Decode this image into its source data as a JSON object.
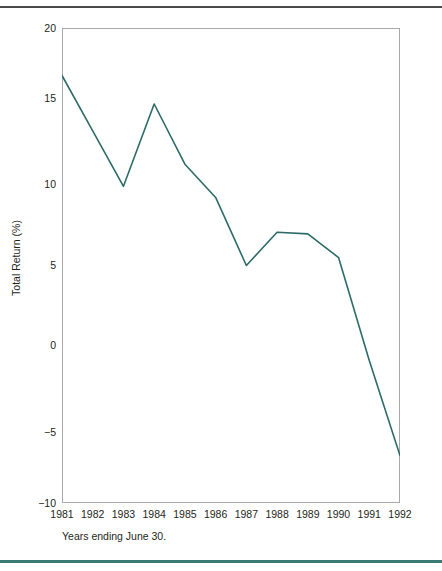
{
  "figure": {
    "caption": "Years ending June 30.",
    "line_color": "#2d6b68",
    "frame_color": "#a7a9ac",
    "rule_top_color": "#4a4a4a",
    "rule_bottom_color": "#3c7a76"
  },
  "chart_data": {
    "type": "line",
    "title": "",
    "xlabel": "",
    "ylabel": "Total Return (%)",
    "categories": [
      "1981",
      "1982",
      "1983",
      "1984",
      "1985",
      "1986",
      "1987",
      "1988",
      "1989",
      "1990",
      "1991",
      "1992"
    ],
    "x": [
      1981,
      1982,
      1983,
      1984,
      1985,
      1986,
      1987,
      1988,
      1989,
      1990,
      1991,
      1992
    ],
    "values": [
      17.0,
      13.5,
      10.0,
      15.2,
      11.4,
      9.3,
      5.0,
      7.1,
      7.0,
      5.5,
      -1.0,
      -7.0
    ],
    "series": [
      {
        "name": "Total Return",
        "color": "#2d6b68",
        "values": [
          17.0,
          13.5,
          10.0,
          15.2,
          11.4,
          9.3,
          5.0,
          7.1,
          7.0,
          5.5,
          -1.0,
          -7.0
        ]
      }
    ],
    "ylim": [
      -10,
      20
    ],
    "yticks": [
      20,
      15,
      10,
      5,
      0,
      -5,
      -10
    ],
    "ytick_labels": [
      "20",
      "15",
      "10",
      "5",
      "0",
      "−5",
      "−10"
    ],
    "xlim": [
      1981,
      1992
    ],
    "grid": false,
    "legend": "none",
    "markers": false,
    "annotations": []
  }
}
